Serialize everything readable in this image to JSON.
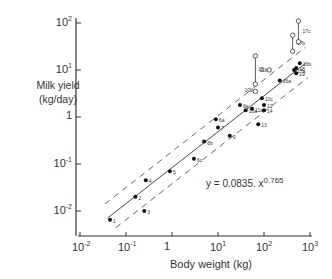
{
  "chart_data": {
    "type": "scatter",
    "title": "",
    "xlabel": "Body weight (kg)",
    "ylabel": "Milk yield (kg/day)",
    "xscale": "log",
    "yscale": "log",
    "xlim": [
      0.01,
      1000
    ],
    "ylim": [
      0.005,
      100
    ],
    "x_ticks": [
      "10^-2",
      "10^-1",
      "1",
      "10^1",
      "10^2",
      "10^3"
    ],
    "y_ticks": [
      "10^-2",
      "10^-1",
      "1",
      "10^1",
      "10^2"
    ],
    "grid": false,
    "annotation": "y = 0.0835 . x^0.765",
    "fit": {
      "a": 0.0835,
      "b": 0.765
    },
    "series": [
      {
        "name": "filled points",
        "marker": "filled-circle",
        "points": [
          {
            "label": "1",
            "x": 0.045,
            "y": 0.0065
          },
          {
            "label": "2",
            "x": 0.16,
            "y": 0.02
          },
          {
            "label": "3",
            "x": 0.25,
            "y": 0.01
          },
          {
            "label": "4",
            "x": 0.27,
            "y": 0.045
          },
          {
            "label": "5",
            "x": 0.9,
            "y": 0.07
          },
          {
            "label": "6c",
            "x": 3.0,
            "y": 0.13
          },
          {
            "label": "6b",
            "x": 5.0,
            "y": 0.3
          },
          {
            "label": "7",
            "x": 10,
            "y": 0.6
          },
          {
            "label": "6a",
            "x": 9,
            "y": 0.9
          },
          {
            "label": "9",
            "x": 18,
            "y": 0.4
          },
          {
            "label": "8a",
            "x": 30,
            "y": 1.8
          },
          {
            "label": "10a",
            "x": 40,
            "y": 1.4
          },
          {
            "label": "11a",
            "x": 55,
            "y": 1.5
          },
          {
            "label": "10c",
            "x": 90,
            "y": 2.5
          },
          {
            "label": "12",
            "x": 100,
            "y": 1.8
          },
          {
            "label": "14",
            "x": 100,
            "y": 1.4
          },
          {
            "label": "13",
            "x": 75,
            "y": 0.7
          },
          {
            "label": "16a",
            "x": 220,
            "y": 6
          },
          {
            "label": "17a",
            "x": 450,
            "y": 10
          },
          {
            "label": "18",
            "x": 500,
            "y": 11
          },
          {
            "label": "19",
            "x": 500,
            "y": 8.5
          },
          {
            "label": "16b",
            "x": 600,
            "y": 14
          }
        ]
      },
      {
        "name": "open points (ranges)",
        "marker": "open-circle",
        "points": [
          {
            "label": "10b",
            "x": 65,
            "y": 3.5
          },
          {
            "label": "11b",
            "x": 65,
            "y": [
              5,
              20
            ]
          },
          {
            "label": "15",
            "x": 130,
            "y": 10
          },
          {
            "label": "17b",
            "x": 420,
            "y": [
              25,
              55
            ]
          },
          {
            "label": "17c",
            "x": 560,
            "y": [
              40,
              110
            ]
          }
        ]
      }
    ]
  },
  "axes": {
    "x_title": "Body weight (kg)",
    "y_title_line1": "Milk yield",
    "y_title_line2": "(kg/day)",
    "equation_base": "y = 0.0835. x",
    "equation_exp": "0.765",
    "x_tick_labels": [
      {
        "base": "10",
        "exp": "-2"
      },
      {
        "base": "10",
        "exp": "-1"
      },
      {
        "base": "1",
        "exp": ""
      },
      {
        "base": "10",
        "exp": "1"
      },
      {
        "base": "10",
        "exp": "2"
      },
      {
        "base": "10",
        "exp": "3"
      }
    ],
    "y_tick_labels": [
      {
        "base": "10",
        "exp": "2"
      },
      {
        "base": "10",
        "exp": "1"
      },
      {
        "base": "1",
        "exp": ""
      },
      {
        "base": "10",
        "exp": "-1"
      },
      {
        "base": "10",
        "exp": "-2"
      }
    ]
  }
}
